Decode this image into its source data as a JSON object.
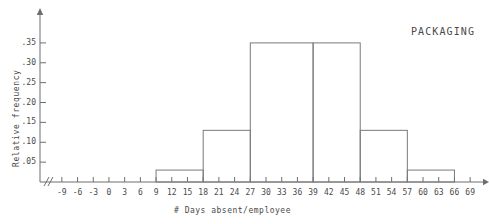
{
  "chart_data": {
    "type": "bar",
    "title": "PACKAGING",
    "xlabel": "# Days absent/employee",
    "ylabel": "Relative frequency",
    "grid": false,
    "legend": null,
    "axis_break_x": true,
    "xlim": [
      -10.5,
      70.5
    ],
    "ylim": [
      0,
      0.385
    ],
    "xticks": [
      "-9",
      "-6",
      "-3",
      "0",
      "3",
      "6",
      "9",
      "12",
      "15",
      "18",
      "21",
      "24",
      "27",
      "30",
      "33",
      "36",
      "39",
      "42",
      "45",
      "48",
      "51",
      "54",
      "57",
      "60",
      "63",
      "66",
      "69"
    ],
    "xtick_values": [
      -9,
      -6,
      -3,
      0,
      3,
      6,
      9,
      12,
      15,
      18,
      21,
      24,
      27,
      30,
      33,
      36,
      39,
      42,
      45,
      48,
      51,
      54,
      57,
      60,
      63,
      66,
      69
    ],
    "yticks": [
      ".05",
      ".10",
      ".15",
      ".20",
      ".25",
      ".30",
      ".35"
    ],
    "ytick_values": [
      0.05,
      0.1,
      0.15,
      0.2,
      0.25,
      0.3,
      0.35
    ],
    "bin_edges": [
      9,
      18,
      27,
      39,
      48,
      57,
      66
    ],
    "bins": [
      {
        "from": 9,
        "to": 18,
        "value": 0.03
      },
      {
        "from": 18,
        "to": 27,
        "value": 0.13
      },
      {
        "from": 27,
        "to": 39,
        "value": 0.35
      },
      {
        "from": 39,
        "to": 48,
        "value": 0.35
      },
      {
        "from": 48,
        "to": 57,
        "value": 0.13
      },
      {
        "from": 57,
        "to": 66,
        "value": 0.03
      }
    ],
    "colors": {
      "axis": "#6e6e6e",
      "bar_stroke": "#7a7a7a",
      "bar_fill": "none",
      "text": "#4a4a4a",
      "background": "#ffffff"
    }
  }
}
